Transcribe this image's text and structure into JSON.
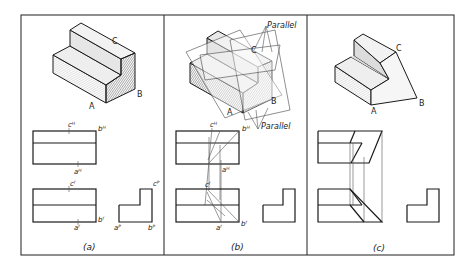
{
  "figure": {
    "panels": [
      {
        "id": "a",
        "caption": "(a)",
        "iso_labels": {
          "A": "A",
          "B": "B",
          "C": "C"
        },
        "top_view_labels": {
          "c": "cᴴ",
          "b": "bᴴ",
          "a": "aᴴ"
        },
        "front_view_labels": {
          "c": "cᶠ",
          "b": "bᶠ",
          "a": "aᶠ"
        },
        "side_view_labels": {
          "c": "cᴾ",
          "a": "aᴾ",
          "b": "bᴾ"
        }
      },
      {
        "id": "b",
        "caption": "(b)",
        "iso_labels": {
          "A": "A",
          "B": "B",
          "C": "C"
        },
        "annotations": {
          "parallel_top": "Parallel",
          "parallel_bottom": "Parallel"
        },
        "top_view_labels": {
          "c": "cᴴ",
          "b": "bᴴ",
          "a": "aᴴ"
        },
        "front_view_labels": {
          "c": "cᶠ",
          "b": "bᶠ",
          "a": "aᶠ"
        }
      },
      {
        "id": "c",
        "caption": "(c)",
        "iso_labels": {
          "A": "A",
          "B": "B",
          "C": "C"
        }
      }
    ]
  }
}
